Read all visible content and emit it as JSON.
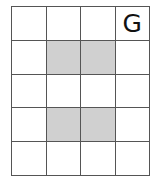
{
  "grid": {
    "rows": 5,
    "cols": 4,
    "shade_color": "#d0d0d0",
    "line_color": "#555555",
    "cells": [
      [
        {
          "label": "",
          "shaded": false
        },
        {
          "label": "",
          "shaded": false
        },
        {
          "label": "",
          "shaded": false
        },
        {
          "label": "G",
          "shaded": false
        }
      ],
      [
        {
          "label": "",
          "shaded": false
        },
        {
          "label": "",
          "shaded": true
        },
        {
          "label": "",
          "shaded": true
        },
        {
          "label": "",
          "shaded": false
        }
      ],
      [
        {
          "label": "",
          "shaded": false
        },
        {
          "label": "",
          "shaded": false
        },
        {
          "label": "",
          "shaded": false
        },
        {
          "label": "",
          "shaded": false
        }
      ],
      [
        {
          "label": "",
          "shaded": false
        },
        {
          "label": "",
          "shaded": true
        },
        {
          "label": "",
          "shaded": true
        },
        {
          "label": "",
          "shaded": false
        }
      ],
      [
        {
          "label": "",
          "shaded": false
        },
        {
          "label": "",
          "shaded": false
        },
        {
          "label": "",
          "shaded": false
        },
        {
          "label": "",
          "shaded": false
        }
      ]
    ]
  }
}
